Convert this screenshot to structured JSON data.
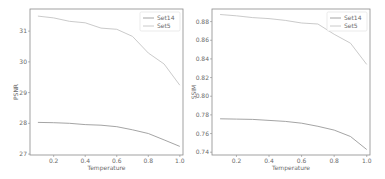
{
  "chart_data": [
    {
      "type": "line",
      "title": "",
      "xlabel": "Temperature",
      "ylabel": "PSNR",
      "x": [
        0.1,
        0.2,
        0.3,
        0.4,
        0.5,
        0.6,
        0.7,
        0.8,
        0.9,
        1.0
      ],
      "xlim": [
        0.05,
        1.02
      ],
      "ylim": [
        26.97,
        31.72
      ],
      "xticks": [
        0.2,
        0.4,
        0.6,
        0.8,
        1.0
      ],
      "xtick_labels": [
        "0.2",
        "0.4",
        "0.6",
        "0.8",
        "1.0"
      ],
      "yticks": [
        27,
        28,
        29,
        30,
        31
      ],
      "ytick_labels": [
        "27",
        "28",
        "29",
        "30",
        "31"
      ],
      "grid": false,
      "legend_position": "top-right",
      "series": [
        {
          "name": "Set14",
          "color": "#9a9a9a",
          "values": [
            28.03,
            28.02,
            28.0,
            27.96,
            27.94,
            27.89,
            27.79,
            27.67,
            27.46,
            27.25
          ]
        },
        {
          "name": "Set5",
          "color": "#c4c4c4",
          "values": [
            31.49,
            31.43,
            31.32,
            31.27,
            31.1,
            31.06,
            30.83,
            30.29,
            29.93,
            29.24
          ]
        }
      ]
    },
    {
      "type": "line",
      "title": "",
      "xlabel": "Temperature",
      "ylabel": "SSIM",
      "x": [
        0.1,
        0.2,
        0.3,
        0.4,
        0.5,
        0.6,
        0.7,
        0.8,
        0.9,
        1.0
      ],
      "xlim": [
        0.05,
        1.02
      ],
      "ylim": [
        0.737,
        0.8935
      ],
      "xticks": [
        0.2,
        0.4,
        0.6,
        0.8,
        1.0
      ],
      "xtick_labels": [
        "0.2",
        "0.4",
        "0.6",
        "0.8",
        "1.0"
      ],
      "yticks": [
        0.74,
        0.76,
        0.78,
        0.8,
        0.82,
        0.84,
        0.86,
        0.88
      ],
      "ytick_labels": [
        "0.74",
        "0.76",
        "0.78",
        "0.80",
        "0.82",
        "0.84",
        "0.86",
        "0.88"
      ],
      "grid": false,
      "legend_position": "top-right",
      "series": [
        {
          "name": "Set14",
          "color": "#9a9a9a",
          "values": [
            0.7758,
            0.7755,
            0.7752,
            0.7741,
            0.773,
            0.7711,
            0.7678,
            0.7637,
            0.7568,
            0.7429
          ]
        },
        {
          "name": "Set5",
          "color": "#c4c4c4",
          "values": [
            0.8876,
            0.8862,
            0.8843,
            0.8832,
            0.8813,
            0.8785,
            0.8774,
            0.8664,
            0.8568,
            0.8341
          ]
        }
      ]
    }
  ]
}
